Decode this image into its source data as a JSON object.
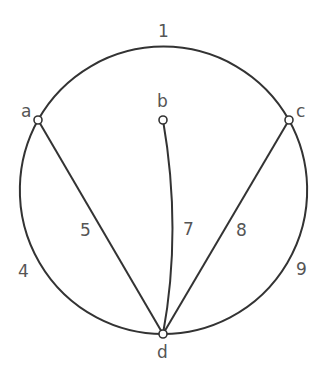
{
  "diagram": {
    "type": "graph",
    "nodes": [
      {
        "id": "a",
        "label": "a",
        "x": 38,
        "y": 120
      },
      {
        "id": "b",
        "label": "b",
        "x": 163,
        "y": 120
      },
      {
        "id": "c",
        "label": "c",
        "x": 289,
        "y": 120
      },
      {
        "id": "d",
        "label": "d",
        "x": 163,
        "y": 334
      }
    ],
    "edges": [
      {
        "id": "e1",
        "label": "1",
        "from": "a",
        "to": "c",
        "shape": "arc-top"
      },
      {
        "id": "e4",
        "label": "4",
        "from": "a",
        "to": "d",
        "shape": "arc-left"
      },
      {
        "id": "e5",
        "label": "5",
        "from": "a",
        "to": "d",
        "shape": "straight"
      },
      {
        "id": "e7",
        "label": "7",
        "from": "b",
        "to": "d",
        "shape": "curve"
      },
      {
        "id": "e8",
        "label": "8",
        "from": "c",
        "to": "d",
        "shape": "straight"
      },
      {
        "id": "e9",
        "label": "9",
        "from": "c",
        "to": "d",
        "shape": "arc-right"
      }
    ]
  },
  "labels": {
    "node_a": "a",
    "node_b": "b",
    "node_c": "c",
    "node_d": "d",
    "edge_1": "1",
    "edge_4": "4",
    "edge_5": "5",
    "edge_7": "7",
    "edge_8": "8",
    "edge_9": "9"
  }
}
